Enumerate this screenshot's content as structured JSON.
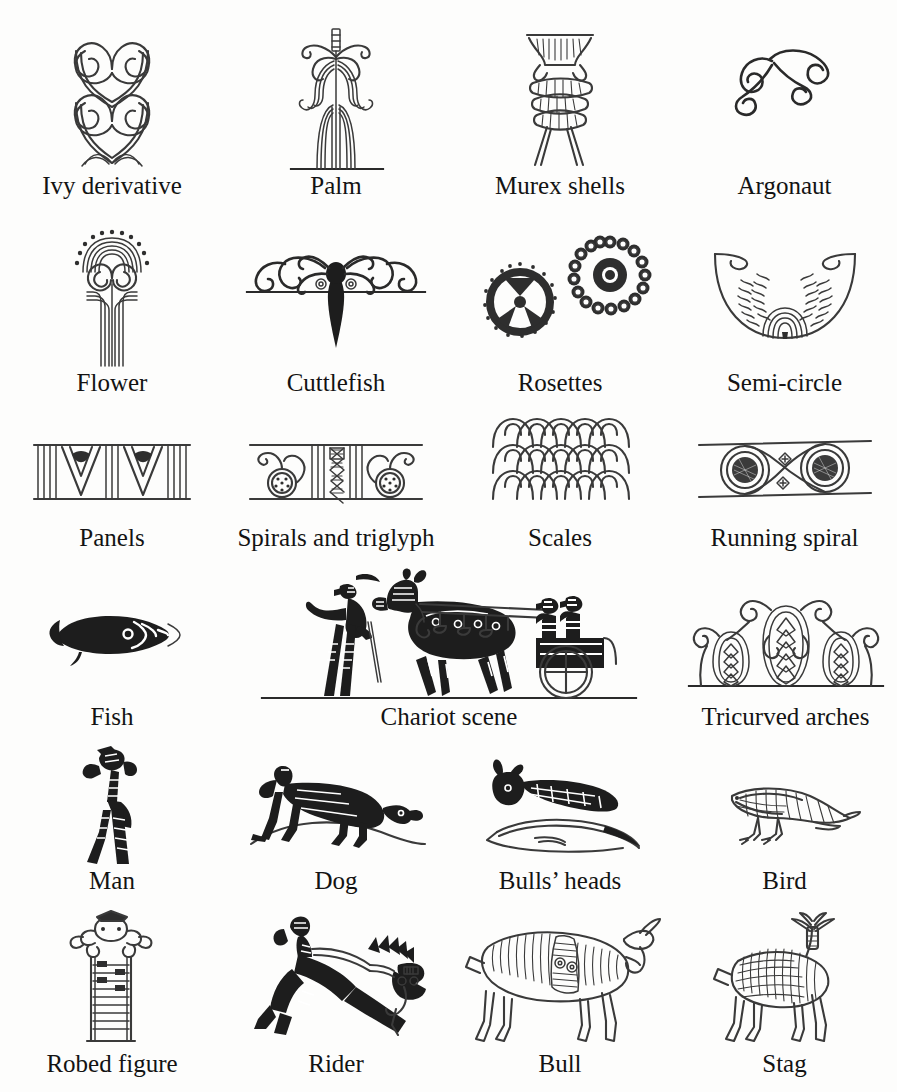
{
  "figure": {
    "cut_title": "Mycenaean pottery motifs",
    "background_color": "#fdfdfc",
    "ink_color": "#2e2e2e",
    "columns": 4,
    "rows": 6
  },
  "motifs": [
    {
      "id": "ivy-derivative",
      "label": "Ivy derivative",
      "row": 1,
      "col": 1,
      "icon": "ivy-derivative-icon"
    },
    {
      "id": "palm",
      "label": "Palm",
      "row": 1,
      "col": 2,
      "icon": "palm-icon"
    },
    {
      "id": "murex-shells",
      "label": "Murex shells",
      "row": 1,
      "col": 3,
      "icon": "murex-shells-icon"
    },
    {
      "id": "argonaut",
      "label": "Argonaut",
      "row": 1,
      "col": 4,
      "icon": "argonaut-icon"
    },
    {
      "id": "flower",
      "label": "Flower",
      "row": 2,
      "col": 1,
      "icon": "flower-icon"
    },
    {
      "id": "cuttlefish",
      "label": "Cuttlefish",
      "row": 2,
      "col": 2,
      "icon": "cuttlefish-icon"
    },
    {
      "id": "rosettes",
      "label": "Rosettes",
      "row": 2,
      "col": 3,
      "icon": "rosettes-icon"
    },
    {
      "id": "semi-circle",
      "label": "Semi-circle",
      "row": 2,
      "col": 4,
      "icon": "semi-circle-icon"
    },
    {
      "id": "panels",
      "label": "Panels",
      "row": 3,
      "col": 1,
      "icon": "panels-icon"
    },
    {
      "id": "spirals-and-triglyph",
      "label": "Spirals and triglyph",
      "row": 3,
      "col": 2,
      "icon": "spirals-triglyph-icon"
    },
    {
      "id": "scales",
      "label": "Scales",
      "row": 3,
      "col": 3,
      "icon": "scales-icon"
    },
    {
      "id": "running-spiral",
      "label": "Running spiral",
      "row": 3,
      "col": 4,
      "icon": "running-spiral-icon"
    },
    {
      "id": "fish",
      "label": "Fish",
      "row": 4,
      "col": 1,
      "icon": "fish-icon"
    },
    {
      "id": "chariot-scene",
      "label": "Chariot scene",
      "row": 4,
      "col": 2,
      "icon": "chariot-scene-icon"
    },
    {
      "id": "tricurved-arches",
      "label": "Tricurved arches",
      "row": 4,
      "col": 4,
      "icon": "tricurved-arches-icon"
    },
    {
      "id": "man",
      "label": "Man",
      "row": 5,
      "col": 1,
      "icon": "man-icon"
    },
    {
      "id": "dog",
      "label": "Dog",
      "row": 5,
      "col": 2,
      "icon": "dog-icon"
    },
    {
      "id": "bulls-heads",
      "label": "Bulls’ heads",
      "row": 5,
      "col": 3,
      "icon": "bulls-heads-icon"
    },
    {
      "id": "bird",
      "label": "Bird",
      "row": 5,
      "col": 4,
      "icon": "bird-icon"
    },
    {
      "id": "robed-figure",
      "label": "Robed figure",
      "row": 6,
      "col": 1,
      "icon": "robed-figure-icon"
    },
    {
      "id": "rider",
      "label": "Rider",
      "row": 6,
      "col": 2,
      "icon": "rider-icon"
    },
    {
      "id": "bull",
      "label": "Bull",
      "row": 6,
      "col": 3,
      "icon": "bull-icon"
    },
    {
      "id": "stag",
      "label": "Stag",
      "row": 6,
      "col": 4,
      "icon": "stag-icon"
    }
  ],
  "labels": {
    "r1c1": "Ivy derivative",
    "r1c2": "Palm",
    "r1c3": "Murex shells",
    "r1c4": "Argonaut",
    "r2c1": "Flower",
    "r2c2": "Cuttlefish",
    "r2c3": "Rosettes",
    "r2c4": "Semi-circle",
    "r3c1": "Panels",
    "r3c2": "Spirals and triglyph",
    "r3c3": "Scales",
    "r3c4": "Running spiral",
    "r4c1": "Fish",
    "r4c2": "Chariot scene",
    "r4c4": "Tricurved arches",
    "r5c1": "Man",
    "r5c2": "Dog",
    "r5c3": "Bulls’ heads",
    "r5c4": "Bird",
    "r6c1": "Robed figure",
    "r6c2": "Rider",
    "r6c3": "Bull",
    "r6c4": "Stag"
  }
}
